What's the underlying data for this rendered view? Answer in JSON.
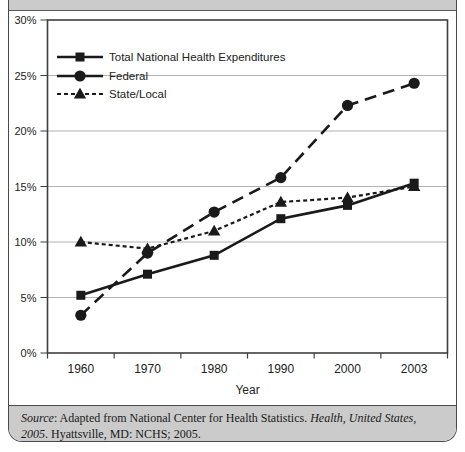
{
  "colors": {
    "line": "#1a1a1a",
    "grid": "#b3b3b3",
    "plot_border": "#3f3f3f",
    "axis_text": "#222222",
    "strip_bg": "#cbcbcb",
    "card_border": "#4a4a4a"
  },
  "chart_data": {
    "type": "line",
    "x_tick_labels": [
      "1960",
      "1970",
      "1980",
      "1990",
      "2000",
      "2003"
    ],
    "series": [
      {
        "name": "Total National Health Expenditures",
        "marker": "square",
        "dash": "solid",
        "values": [
          5.2,
          7.1,
          8.8,
          12.1,
          13.3,
          15.3
        ]
      },
      {
        "name": "Federal",
        "marker": "circle",
        "dash": "long-dash",
        "values": [
          3.4,
          9.0,
          12.7,
          15.8,
          22.3,
          24.3
        ]
      },
      {
        "name": "State/Local",
        "marker": "triangle",
        "dash": "short-dash",
        "values": [
          10.0,
          9.4,
          11.0,
          13.6,
          14.0,
          15.0
        ]
      }
    ],
    "xlabel": "Year",
    "ylim": [
      0,
      30
    ],
    "ytick_step": 5,
    "ytick_labels": [
      "0%",
      "5%",
      "10%",
      "15%",
      "20%",
      "25%",
      "30%"
    ],
    "grid": true,
    "legend_position": "top-left"
  },
  "source_note": {
    "segments": [
      {
        "text": "Source",
        "italic": true
      },
      {
        "text": ": Adapted from National Center for Health Statistics. ",
        "italic": false
      },
      {
        "text": "Health, United States, 2005",
        "italic": true
      },
      {
        "text": ". Hyattsville, MD: NCHS; 2005.",
        "italic": false
      }
    ]
  }
}
